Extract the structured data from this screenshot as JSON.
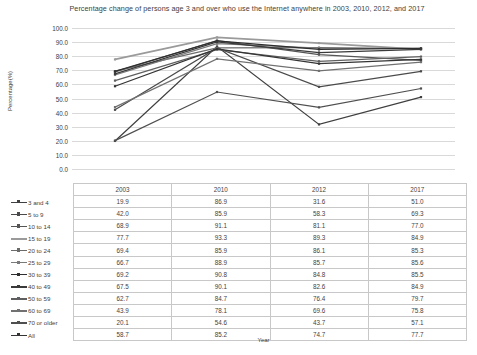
{
  "chart_data": {
    "type": "line",
    "title": "Percentage change of persons age 3 and over who use the Internet anywhere in 2003, 2010, 2012, and 2017",
    "xlabel": "Year",
    "ylabel": "Percentage(%)",
    "categories": [
      "2003",
      "2010",
      "2012",
      "2017"
    ],
    "ylim": [
      0.0,
      100.0
    ],
    "ytick_labels": [
      "100.0",
      "90.0",
      "80.0",
      "70.0",
      "60.0",
      "50.0",
      "40.0",
      "30.0",
      "20.0",
      "10.0",
      "0.0"
    ],
    "grid": true,
    "legend_position": "table-left",
    "series": [
      {
        "name": "3 and 4",
        "values": [
          19.9,
          86.9,
          31.6,
          51.0
        ],
        "color": "#3f3f3f"
      },
      {
        "name": "5 to 9",
        "values": [
          42.0,
          85.9,
          58.3,
          69.3
        ],
        "color": "#4a4a4a"
      },
      {
        "name": "10 to 14",
        "values": [
          68.9,
          91.1,
          81.1,
          77.0
        ],
        "color": "#555555"
      },
      {
        "name": "15 to 19",
        "values": [
          77.7,
          93.3,
          89.3,
          84.9
        ],
        "color": "#9a9a9a"
      },
      {
        "name": "20 to 24",
        "values": [
          69.4,
          85.9,
          86.1,
          85.3
        ],
        "color": "#6b6b6b"
      },
      {
        "name": "25 to 29",
        "values": [
          66.7,
          88.9,
          85.7,
          85.6
        ],
        "color": "#7a7a7a"
      },
      {
        "name": "30 to 39",
        "values": [
          69.2,
          90.8,
          84.8,
          85.5
        ],
        "color": "#2e2e2e"
      },
      {
        "name": "40 to 49",
        "values": [
          67.5,
          90.1,
          82.6,
          84.9
        ],
        "color": "#3a3a3a"
      },
      {
        "name": "50 to 59",
        "values": [
          62.7,
          84.7,
          76.4,
          79.7
        ],
        "color": "#5f5f5f"
      },
      {
        "name": "60 to 69",
        "values": [
          43.9,
          78.1,
          69.6,
          75.8
        ],
        "color": "#717171"
      },
      {
        "name": "70 or older",
        "values": [
          20.1,
          54.6,
          43.7,
          57.1
        ],
        "color": "#4f4f4f"
      },
      {
        "name": "All",
        "values": [
          58.7,
          85.2,
          74.7,
          77.7
        ],
        "color": "#343434"
      }
    ]
  },
  "table": {
    "header_blank": "",
    "columns": [
      "2003",
      "2010",
      "2012",
      "2017"
    ]
  }
}
